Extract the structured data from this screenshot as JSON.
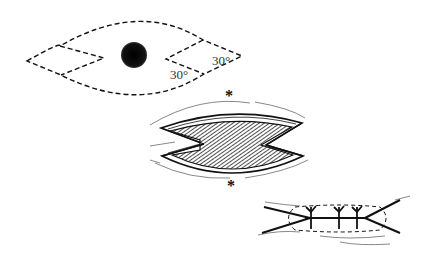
{
  "figure": {
    "steps": [
      {
        "id": "step-1-incision-plan",
        "elements": [
          "dashed-lens-outline",
          "lesion",
          "notched-flaps"
        ],
        "labels": [
          {
            "text": "30°",
            "position": "upper-right-flap"
          },
          {
            "text": "30°",
            "position": "lower-right-flap"
          }
        ]
      },
      {
        "id": "step-2-open-defect",
        "elements": [
          "hatched-wound-bed",
          "skin-edges",
          "markers"
        ],
        "markers": [
          {
            "text": "*",
            "position": "top"
          },
          {
            "text": "*",
            "position": "bottom"
          }
        ]
      },
      {
        "id": "step-3-closure",
        "elements": [
          "closed-incision-lines",
          "dashed-outline",
          "sutures"
        ],
        "suture_count": 3
      }
    ]
  },
  "labels": {
    "angle_upper": "30°",
    "angle_lower": "30°",
    "marker_top": "*",
    "marker_bottom": "*"
  },
  "colors": {
    "ink": "#111111",
    "label": "#333333",
    "background": "#ffffff"
  }
}
